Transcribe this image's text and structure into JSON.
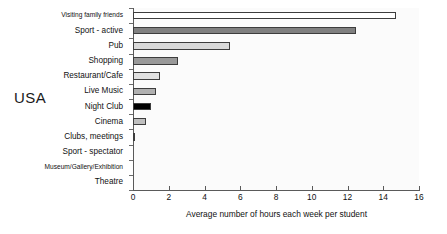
{
  "group_label": "USA",
  "chart_data": {
    "type": "bar",
    "orientation": "horizontal",
    "title": "",
    "subtitle": "",
    "xlabel": "Average number of hours each week per student",
    "ylabel": "",
    "xlim": [
      0,
      16
    ],
    "xticks": [
      0,
      2,
      4,
      6,
      8,
      10,
      12,
      14,
      16
    ],
    "xtick_labels": [
      "0",
      "2",
      "4",
      "6",
      "8",
      "10",
      "12",
      "14",
      "16"
    ],
    "grid": false,
    "legend": false,
    "legend_position": "none",
    "categories": [
      "Visiting family friends",
      "Sport - active",
      "Pub",
      "Shopping",
      "Restaurant/Cafe",
      "Live Music",
      "Night Club",
      "Cinema",
      "Clubs, meetings",
      "Sport - spectator",
      "Museum/Gallery/Exhibition",
      "Theatre"
    ],
    "values": [
      14.7,
      12.5,
      5.4,
      2.5,
      1.5,
      1.3,
      1.0,
      0.7,
      0.1,
      0.0,
      0.0,
      0.0
    ],
    "bar_colors": [
      "#ffffff",
      "#808080",
      "#d9d9d9",
      "#999999",
      "#e0e0e0",
      "#b0b0b0",
      "#000000",
      "#bfbfbf",
      "#8a8a8a",
      "#cccccc",
      "#cccccc",
      "#cccccc"
    ],
    "bar_edge_color": "#3d3d3d",
    "plot_background": "#fbfbfb",
    "axis_color": "#5a5a5a"
  }
}
